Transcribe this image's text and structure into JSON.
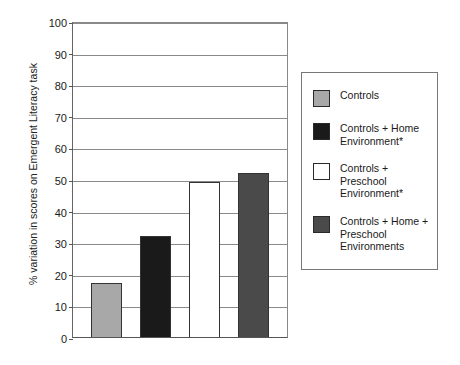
{
  "chart_data": {
    "type": "bar",
    "title": "",
    "subtitle": "",
    "xlabel": "",
    "ylabel": "% variation in scores on Emergent Literacy task",
    "ylim": [
      0,
      100
    ],
    "yticks": [
      0,
      10,
      20,
      30,
      40,
      50,
      60,
      70,
      80,
      90,
      100
    ],
    "ytick_labels": [
      "0",
      "10",
      "20",
      "30",
      "40",
      "50",
      "60",
      "70",
      "80",
      "90",
      "100"
    ],
    "grid": "horizontal",
    "xtick_labels": [
      "",
      "",
      "",
      ""
    ],
    "legend_position": "right-outside",
    "categories": [
      "Controls",
      "Controls + Home Environment*",
      "Controls + Preschool Environment*",
      "Controls + Home + Preschool Environments"
    ],
    "values": [
      17,
      32,
      49,
      52
    ],
    "colors": [
      "#a8a8a8",
      "#1a1a1a",
      "#ffffff",
      "#4a4a4a"
    ],
    "bar_edge_color": "#333333",
    "bars": [
      {
        "label": "Controls",
        "value": 17,
        "color": "#a8a8a8"
      },
      {
        "label": "Controls + Home Environment*",
        "value": 32,
        "color": "#1a1a1a"
      },
      {
        "label": "Controls + Preschool Environment*",
        "value": 49,
        "color": "#ffffff"
      },
      {
        "label": "Controls + Home + Preschool Environments",
        "value": 52,
        "color": "#4a4a4a"
      }
    ]
  },
  "legend": {
    "items": [
      {
        "label": "Controls",
        "color": "#a8a8a8"
      },
      {
        "label": "Controls + Home\nEnvironment*",
        "color": "#1a1a1a"
      },
      {
        "label": "Controls +\nPreschool\nEnvironment*",
        "color": "#ffffff"
      },
      {
        "label": "Controls + Home +\nPreschool\nEnvironments",
        "color": "#4a4a4a"
      }
    ]
  }
}
